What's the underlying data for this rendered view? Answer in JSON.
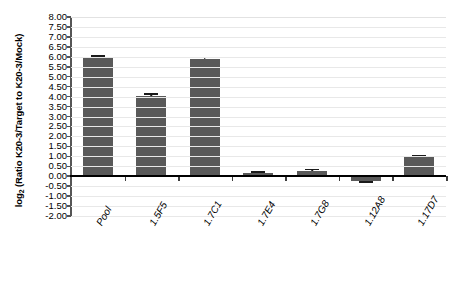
{
  "chart_data": {
    "type": "bar",
    "title": "",
    "subtitle": "",
    "xlabel": "",
    "ylabel": "log₂ (Ratio K20-3/Target to K20-3/Mock)",
    "ylabel_main": "log",
    "ylabel_sub": "2",
    "ylabel_rest": " (Ratio K20-3/Target to K20-3/Mock)",
    "categories": [
      "Pool",
      "1.5F5",
      "1.7C1",
      "1.7E4",
      "1.7G8",
      "1.12A8",
      "1.17D7"
    ],
    "values": [
      5.97,
      4.05,
      5.9,
      0.15,
      0.27,
      -0.23,
      0.97
    ],
    "errors": [
      0.08,
      0.07,
      0.07,
      0.05,
      0.06,
      0.05,
      0.07
    ],
    "series": [
      {
        "name": "log2 ratio",
        "values": [
          5.97,
          4.05,
          5.9,
          0.15,
          0.27,
          -0.23,
          0.97
        ]
      }
    ],
    "ylim": [
      -2.0,
      8.0
    ],
    "ytick_step": 0.5,
    "ytick_labels": [
      "8.00",
      "7.50",
      "7.00",
      "6.50",
      "6.00",
      "5.50",
      "5.00",
      "4.50",
      "4.00",
      "3.50",
      "3.00",
      "2.50",
      "2.00",
      "1.50",
      "1.00",
      "0.50",
      "0.00",
      "-0.50",
      "-1.00",
      "-1.50",
      "-2.00"
    ],
    "ytick_values": [
      8.0,
      7.5,
      7.0,
      6.5,
      6.0,
      5.5,
      5.0,
      4.5,
      4.0,
      3.5,
      3.0,
      2.5,
      2.0,
      1.5,
      1.0,
      0.5,
      0.0,
      -0.5,
      -1.0,
      -1.5,
      -2.0
    ],
    "grid": true,
    "legend": false,
    "legend_position": "none",
    "bar_color": "#595959",
    "gridline_color": "#e8e8e8",
    "axis_color": "#000000",
    "background_color": "#ffffff"
  }
}
